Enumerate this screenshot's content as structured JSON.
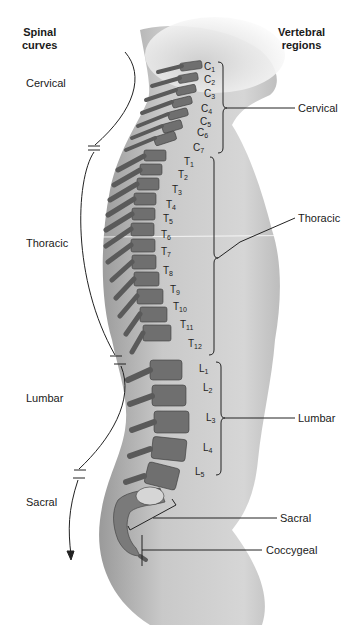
{
  "headers": {
    "left": [
      "Spinal",
      "curves"
    ],
    "right": [
      "Vertebral",
      "regions"
    ]
  },
  "spinal_curves": [
    {
      "label": "Cervical"
    },
    {
      "label": "Thoracic"
    },
    {
      "label": "Lumbar"
    },
    {
      "label": "Sacral"
    }
  ],
  "vertebral_regions": [
    {
      "label": "Cervical"
    },
    {
      "label": "Thoracic"
    },
    {
      "label": "Lumbar"
    },
    {
      "label": "Sacral"
    },
    {
      "label": "Coccygeal"
    }
  ],
  "vertebrae": {
    "cervical": [
      {
        "letter": "C",
        "num": "1"
      },
      {
        "letter": "C",
        "num": "2"
      },
      {
        "letter": "C",
        "num": "3"
      },
      {
        "letter": "C",
        "num": "4"
      },
      {
        "letter": "C",
        "num": "5"
      },
      {
        "letter": "C",
        "num": "6"
      },
      {
        "letter": "C",
        "num": "7"
      }
    ],
    "thoracic": [
      {
        "letter": "T",
        "num": "1"
      },
      {
        "letter": "T",
        "num": "2"
      },
      {
        "letter": "T",
        "num": "3"
      },
      {
        "letter": "T",
        "num": "4"
      },
      {
        "letter": "T",
        "num": "5"
      },
      {
        "letter": "T",
        "num": "6"
      },
      {
        "letter": "T",
        "num": "7"
      },
      {
        "letter": "T",
        "num": "8"
      },
      {
        "letter": "T",
        "num": "9"
      },
      {
        "letter": "T",
        "num": "10"
      },
      {
        "letter": "T",
        "num": "11"
      },
      {
        "letter": "T",
        "num": "12"
      }
    ],
    "lumbar": [
      {
        "letter": "L",
        "num": "1"
      },
      {
        "letter": "L",
        "num": "2"
      },
      {
        "letter": "L",
        "num": "3"
      },
      {
        "letter": "L",
        "num": "4"
      },
      {
        "letter": "L",
        "num": "5"
      }
    ]
  }
}
